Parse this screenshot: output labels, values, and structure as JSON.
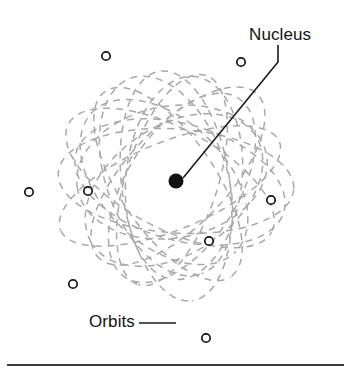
{
  "figure": {
    "kind": "atom-model-diagram",
    "title_visible": false,
    "background_color": "#ffffff",
    "width": 351,
    "height": 369
  },
  "labels": {
    "nucleus": "Nucleus",
    "orbits": "Orbits"
  },
  "colors": {
    "orbit_stroke": "#a8a8a8",
    "nucleus_fill": "#111111",
    "electron_stroke": "#141414",
    "electron_fill": "#ffffff",
    "leader_line": "#1a1a1a",
    "rule": "#3c3c3c",
    "text": "#121212"
  },
  "nucleus": {
    "cx": 176,
    "cy": 181,
    "r": 7.5
  },
  "electrons": [
    {
      "cx": 106,
      "cy": 56,
      "r": 4.2
    },
    {
      "cx": 241,
      "cy": 62,
      "r": 4.2
    },
    {
      "cx": 29,
      "cy": 192,
      "r": 4.2
    },
    {
      "cx": 88,
      "cy": 191,
      "r": 4.2
    },
    {
      "cx": 271,
      "cy": 200,
      "r": 4.2
    },
    {
      "cx": 209,
      "cy": 241,
      "r": 4.2
    },
    {
      "cx": 73,
      "cy": 284,
      "r": 4.2
    },
    {
      "cx": 206,
      "cy": 338,
      "r": 4.2
    }
  ],
  "orbits": [
    {
      "cx": 176,
      "cy": 181,
      "rx": 118,
      "ry": 52,
      "rotate": 4
    },
    {
      "cx": 170,
      "cy": 178,
      "rx": 115,
      "ry": 50,
      "rotate": 28
    },
    {
      "cx": 168,
      "cy": 184,
      "rx": 112,
      "ry": 48,
      "rotate": 56
    },
    {
      "cx": 176,
      "cy": 186,
      "rx": 116,
      "ry": 54,
      "rotate": 82
    },
    {
      "cx": 172,
      "cy": 180,
      "rx": 110,
      "ry": 46,
      "rotate": 108
    },
    {
      "cx": 178,
      "cy": 176,
      "rx": 114,
      "ry": 50,
      "rotate": 134
    },
    {
      "cx": 170,
      "cy": 186,
      "rx": 118,
      "ry": 44,
      "rotate": 158
    },
    {
      "cx": 180,
      "cy": 182,
      "rx": 108,
      "ry": 58,
      "rotate": 16
    },
    {
      "cx": 166,
      "cy": 176,
      "rx": 104,
      "ry": 60,
      "rotate": 70
    },
    {
      "cx": 182,
      "cy": 188,
      "rx": 106,
      "ry": 56,
      "rotate": 122
    },
    {
      "cx": 164,
      "cy": 182,
      "rx": 100,
      "ry": 62,
      "rotate": 44
    },
    {
      "cx": 184,
      "cy": 178,
      "rx": 102,
      "ry": 58,
      "rotate": 96
    },
    {
      "cx": 174,
      "cy": 190,
      "rx": 98,
      "ry": 64,
      "rotate": 146
    },
    {
      "cx": 172,
      "cy": 172,
      "rx": 96,
      "ry": 66,
      "rotate": 170
    }
  ],
  "leader_lines": {
    "nucleus": {
      "points": "278,45 278,62 183,178"
    },
    "orbits": {
      "points": "139,323 176,323"
    }
  },
  "bottom_rule": {
    "x1": 7,
    "x2": 344,
    "y": 365,
    "thickness": 2.2
  }
}
